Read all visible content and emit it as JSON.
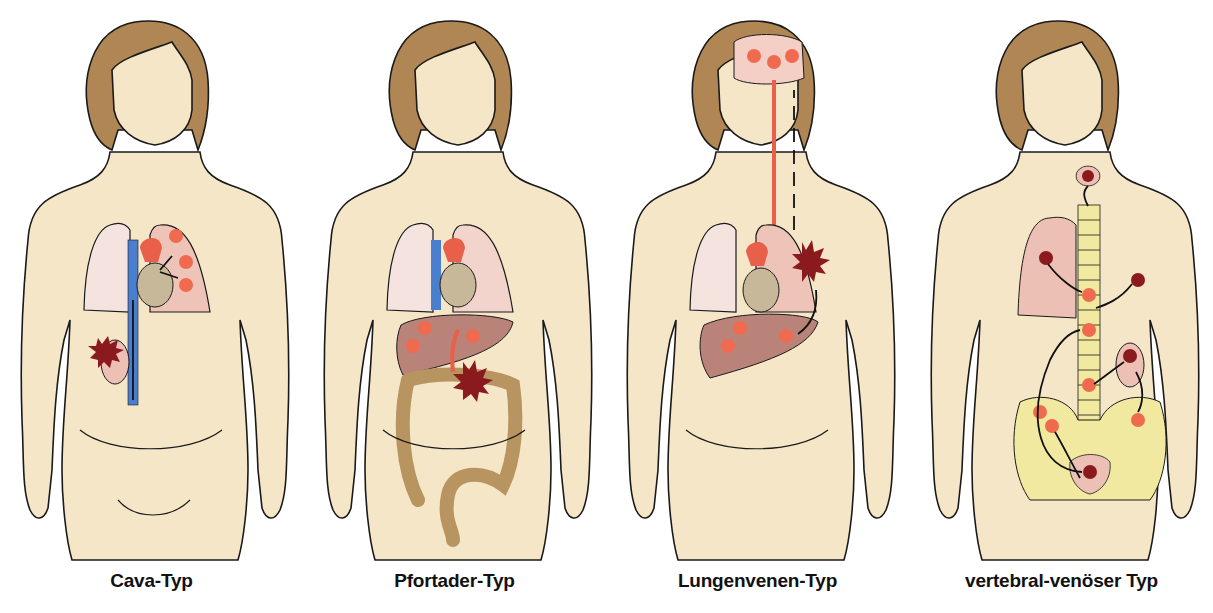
{
  "figure": {
    "panels": [
      {
        "id": "cava",
        "caption": "Cava-Typ",
        "description": "Primary tumor in kidney spreads via vena cava to heart and lungs",
        "primary_tumor": "kidney",
        "metastases": [
          "lung"
        ]
      },
      {
        "id": "pfortader",
        "caption": "Pfortader-Typ",
        "description": "Primary tumor in colon spreads via portal vein to liver",
        "primary_tumor": "colon",
        "metastases": [
          "liver"
        ]
      },
      {
        "id": "lungenvenen",
        "caption": "Lungenvenen-Typ",
        "description": "Primary tumor in lung spreads via pulmonary veins and arterial circulation to brain and liver",
        "primary_tumor": "lung",
        "metastases": [
          "brain",
          "liver"
        ]
      },
      {
        "id": "vertebral",
        "caption": "vertebral-venöser Typ",
        "description": "Primary tumors in thyroid, lung, breast, kidney, bladder spread via vertebral venous plexus to spine and pelvis",
        "primary_tumor": "thyroid, lung, breast, kidney, bladder",
        "metastases": [
          "vertebrae",
          "pelvis"
        ]
      }
    ]
  },
  "colors": {
    "skin": "#f5e6c8",
    "hair": "#b08654",
    "outline": "#1a1a1a",
    "lung": "#f3d8d0",
    "lung_affected": "#efc4b8",
    "vein": "#4a7fcf",
    "artery": "#e8604a",
    "primary_tumor": "#8b1a1f",
    "metastasis": "#ef6a4f",
    "liver": "#b9837a",
    "colon": "#b89460",
    "bone": "#f1e9a0",
    "brain": "#f3cfc6"
  }
}
